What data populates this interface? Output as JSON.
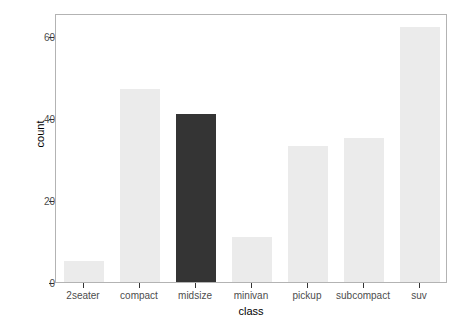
{
  "chart_data": {
    "type": "bar",
    "title": "",
    "xlabel": "class",
    "ylabel": "count",
    "categories": [
      "2seater",
      "compact",
      "midsize",
      "minivan",
      "pickup",
      "subcompact",
      "suv"
    ],
    "values": [
      5,
      47,
      41,
      11,
      33,
      35,
      62
    ],
    "ylim": [
      0,
      65.5
    ],
    "yticks": [
      0,
      20,
      40,
      60
    ],
    "ytick_labels": [
      "0",
      "20",
      "40",
      "60"
    ],
    "grid": false,
    "legend": "none",
    "bar_colors": [
      "#ebebeb",
      "#ebebeb",
      "#343434",
      "#ebebeb",
      "#ebebeb",
      "#ebebeb",
      "#ebebeb"
    ],
    "highlighted_category": "midsize",
    "panel_background": "#ffffff",
    "panel_border_color": "#b3b3b3",
    "axis_text_color": "#4d4d4d",
    "title_text_color": "#000000"
  }
}
